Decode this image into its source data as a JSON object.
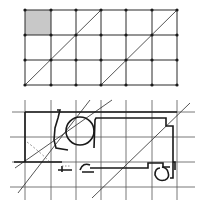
{
  "colors": {
    "line": "#2a2a2a",
    "grid_light": "#555555",
    "shade": "#c8c8c8",
    "background": "#ffffff"
  },
  "top_diagram": {
    "description": "6x3 square grid with nodes at every intersection, one shaded top-left cell, and two parallel diagonals",
    "columns": 6,
    "rows": 3,
    "x_positions": [
      25,
      51,
      76,
      101,
      126,
      152,
      177
    ],
    "y_positions": [
      10,
      35,
      60,
      85
    ],
    "shaded_cell": {
      "col": 0,
      "row": 0
    },
    "diagonals": [
      {
        "from": [
          25,
          85
        ],
        "to": [
          101,
          10
        ]
      },
      {
        "from": [
          101,
          85
        ],
        "to": [
          177,
          10
        ]
      }
    ]
  },
  "bottom_diagram": {
    "description": "Architectural floor plan overlaid on a square grid with parallel diagonal regulating lines",
    "x_positions": [
      25,
      51,
      76,
      101,
      126,
      152,
      177
    ],
    "y_positions": [
      112,
      137,
      162,
      187
    ],
    "diagonals": [
      {
        "from": [
          18,
          193
        ],
        "to": [
          90,
          100
        ]
      },
      {
        "from": [
          15,
          168
        ],
        "to": [
          112,
          100
        ]
      },
      {
        "from": [
          92,
          198
        ],
        "to": [
          190,
          103
        ]
      }
    ]
  }
}
